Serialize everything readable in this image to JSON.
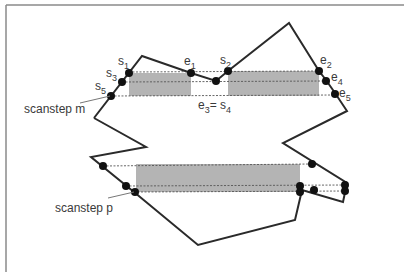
{
  "figure": {
    "colors": {
      "outline": "#2a2a2a",
      "span_fill": "#b4b4b4",
      "dashed": "#555555",
      "frame": "#8a8a8a",
      "label": "#3a3a3a",
      "point": "#111111"
    }
  },
  "labels": {
    "s1": {
      "base": "s",
      "sub": "1"
    },
    "s2": {
      "base": "s",
      "sub": "2"
    },
    "s3": {
      "base": "s",
      "sub": "3"
    },
    "s5": {
      "base": "s",
      "sub": "5"
    },
    "e1": {
      "base": "e",
      "sub": "1"
    },
    "e2": {
      "base": "e",
      "sub": "2"
    },
    "e4": {
      "base": "e",
      "sub": "4"
    },
    "e5": {
      "base": "e",
      "sub": "5"
    },
    "e3_eq_s4": {
      "base1": "e",
      "sub1": "3",
      "eq": "= ",
      "base2": "s",
      "sub2": "4"
    },
    "scanstep_m": "scanstep m",
    "scanstep_p": "scanstep p"
  }
}
